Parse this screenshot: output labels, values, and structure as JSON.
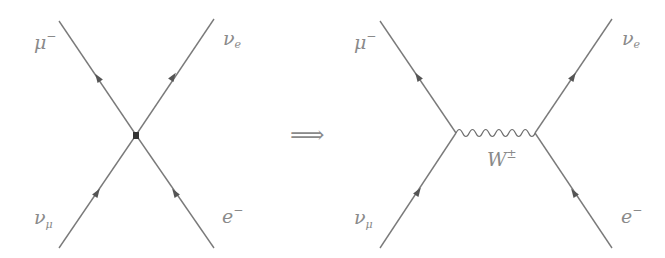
{
  "figure": {
    "implies_symbol": "⟹",
    "left_diagram": {
      "name": "Fermi contact interaction",
      "vertex": "point-contact",
      "labels": {
        "top_left": {
          "base": "μ",
          "sup": "−",
          "sub": ""
        },
        "top_right": {
          "base": "ν",
          "sup": "",
          "sub": "e"
        },
        "bottom_left": {
          "base": "ν",
          "sup": "",
          "sub": "μ"
        },
        "bottom_right": {
          "base": "e",
          "sup": "−",
          "sub": ""
        }
      }
    },
    "right_diagram": {
      "name": "W boson exchange",
      "propagator": {
        "base": "W",
        "sup": "±"
      },
      "labels": {
        "top_left": {
          "base": "μ",
          "sup": "−",
          "sub": ""
        },
        "top_right": {
          "base": "ν",
          "sup": "",
          "sub": "e"
        },
        "bottom_left": {
          "base": "ν",
          "sup": "",
          "sub": "μ"
        },
        "bottom_right": {
          "base": "e",
          "sup": "−",
          "sub": ""
        }
      }
    },
    "colors": {
      "line": "#7a7a7a",
      "arrow": "#555555",
      "label": "#8a8a8a",
      "background": "#ffffff"
    }
  }
}
